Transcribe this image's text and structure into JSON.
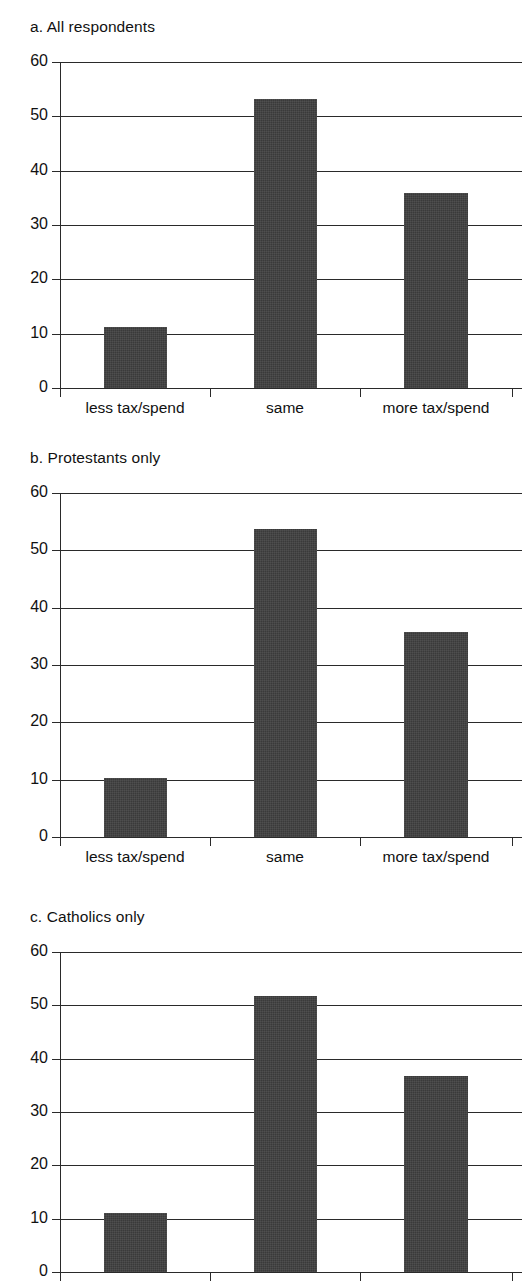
{
  "figure": {
    "panels": [
      {
        "title": "a. All respondents",
        "chart": {
          "type": "bar",
          "title": "a. All respondents",
          "categories": [
            "less tax/spend",
            "same",
            "more tax/spend"
          ],
          "values": [
            11.2,
            53.2,
            35.8
          ],
          "xlabel": "",
          "ylabel": "",
          "ylim": [
            0,
            60
          ],
          "yticks": [
            "0",
            "10",
            "20",
            "30",
            "40",
            "50",
            "60"
          ],
          "grid": true,
          "legend": null,
          "bar_color": "#3a3a3a"
        }
      },
      {
        "title": "b. Protestants only",
        "chart": {
          "type": "bar",
          "title": "b. Protestants only",
          "categories": [
            "less tax/spend",
            "same",
            "more tax/spend"
          ],
          "values": [
            10.3,
            53.7,
            35.8
          ],
          "xlabel": "",
          "ylabel": "",
          "ylim": [
            0,
            60
          ],
          "yticks": [
            "0",
            "10",
            "20",
            "30",
            "40",
            "50",
            "60"
          ],
          "grid": true,
          "legend": null,
          "bar_color": "#3a3a3a"
        }
      },
      {
        "title": "c. Catholics only",
        "chart": {
          "type": "bar",
          "title": "c. Catholics only",
          "categories": [
            "less tax/spend",
            "same",
            "more tax/spend"
          ],
          "values": [
            11.1,
            51.8,
            36.7
          ],
          "xlabel": "",
          "ylabel": "",
          "ylim": [
            0,
            60
          ],
          "yticks": [
            "0",
            "10",
            "20",
            "30",
            "40",
            "50",
            "60"
          ],
          "grid": true,
          "legend": null,
          "bar_color": "#3a3a3a"
        }
      }
    ]
  },
  "chart_data": [
    {
      "type": "bar",
      "title": "a. All respondents",
      "categories": [
        "less tax/spend",
        "same",
        "more tax/spend"
      ],
      "values": [
        11.2,
        53.2,
        35.8
      ],
      "xlabel": "",
      "ylabel": "",
      "ylim": [
        0,
        60
      ],
      "yticks": [
        0,
        10,
        20,
        30,
        40,
        50,
        60
      ],
      "grid": true,
      "legend": null
    },
    {
      "type": "bar",
      "title": "b. Protestants only",
      "categories": [
        "less tax/spend",
        "same",
        "more tax/spend"
      ],
      "values": [
        10.3,
        53.7,
        35.8
      ],
      "xlabel": "",
      "ylabel": "",
      "ylim": [
        0,
        60
      ],
      "yticks": [
        0,
        10,
        20,
        30,
        40,
        50,
        60
      ],
      "grid": true,
      "legend": null
    },
    {
      "type": "bar",
      "title": "c. Catholics only",
      "categories": [
        "less tax/spend",
        "same",
        "more tax/spend"
      ],
      "values": [
        11.1,
        51.8,
        36.7
      ],
      "xlabel": "",
      "ylabel": "",
      "ylim": [
        0,
        60
      ],
      "yticks": [
        0,
        10,
        20,
        30,
        40,
        50,
        60
      ],
      "grid": true,
      "legend": null
    }
  ]
}
